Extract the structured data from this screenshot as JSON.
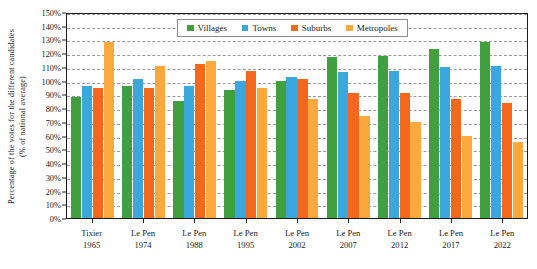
{
  "chart_data": {
    "type": "bar",
    "title": "",
    "xlabel": "",
    "ylabel": "Percentage of the votes for the different candidates (% of national average)",
    "ylabel_line1": "Percentage of the votes for the different candidates",
    "ylabel_line2": "(% of national average)",
    "ylim": [
      0,
      150
    ],
    "ytick_step": 10,
    "ytick_labels": [
      "0%",
      "10%",
      "20%",
      "30%",
      "40%",
      "50%",
      "60%",
      "70%",
      "80%",
      "90%",
      "100%",
      "110%",
      "120%",
      "130%",
      "140%",
      "150%"
    ],
    "grid": true,
    "grid_style": "dashed-horizontal",
    "legend_position": "top-center-inside",
    "categories": [
      {
        "name": "Tixier",
        "year": "1965"
      },
      {
        "name": "Le Pen",
        "year": "1974"
      },
      {
        "name": "Le Pen",
        "year": "1988"
      },
      {
        "name": "Le Pen",
        "year": "1995"
      },
      {
        "name": "Le Pen",
        "year": "2002"
      },
      {
        "name": "Le Pen",
        "year": "2007"
      },
      {
        "name": "Le Pen",
        "year": "2012"
      },
      {
        "name": "Le Pen",
        "year": "2017"
      },
      {
        "name": "Le Pen",
        "year": "2022"
      }
    ],
    "series": [
      {
        "name": "Villages",
        "color": "#40a040",
        "values": [
          88,
          96,
          85,
          93,
          100,
          117,
          118,
          123,
          128
        ]
      },
      {
        "name": "Towns",
        "color": "#3ba8dd",
        "values": [
          96,
          101,
          96,
          100,
          103,
          106,
          107,
          110,
          111
        ]
      },
      {
        "name": "Suburbs",
        "color": "#f4681e",
        "values": [
          95,
          95,
          112,
          107,
          101,
          91,
          91,
          87,
          84
        ]
      },
      {
        "name": "Metropoles",
        "color": "#f9a93d",
        "values": [
          128,
          111,
          114,
          95,
          87,
          74,
          70,
          60,
          55
        ]
      }
    ]
  }
}
